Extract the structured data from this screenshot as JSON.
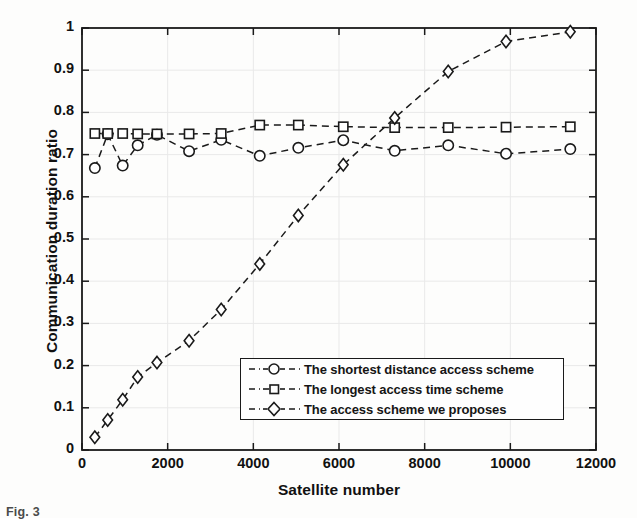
{
  "figure": {
    "caption": "Fig. 3"
  },
  "chart_data": {
    "type": "line",
    "title": "",
    "xlabel": "Satellite number",
    "ylabel": "Communication duration ratio",
    "xlim": [
      0,
      12000
    ],
    "ylim": [
      0,
      1
    ],
    "xticks": [
      0,
      2000,
      4000,
      6000,
      8000,
      10000,
      12000
    ],
    "xtick_labels": [
      "0",
      "2000",
      "4000",
      "6000",
      "8000",
      "10000",
      "12000"
    ],
    "yticks": [
      0,
      0.1,
      0.2,
      0.3,
      0.4,
      0.5,
      0.6,
      0.7,
      0.8,
      0.9,
      1
    ],
    "ytick_labels": [
      "0",
      "0.1",
      "0.2",
      "0.3",
      "0.4",
      "0.5",
      "0.6",
      "0.7",
      "0.8",
      "0.9",
      "1"
    ],
    "grid": true,
    "legend_position": "lower-center-right",
    "linestyle": "dashed",
    "color": "#1a1a1a",
    "series": [
      {
        "name": "The shortest distance access scheme",
        "marker": "circle",
        "x": [
          300,
          600,
          950,
          1300,
          1750,
          2500,
          3250,
          4150,
          5050,
          6100,
          7300,
          8550,
          9900,
          11400
        ],
        "y": [
          0.668,
          0.748,
          0.674,
          0.722,
          0.747,
          0.708,
          0.735,
          0.697,
          0.716,
          0.734,
          0.709,
          0.722,
          0.702,
          0.713
        ]
      },
      {
        "name": "The longest access time scheme",
        "marker": "square",
        "x": [
          300,
          600,
          950,
          1300,
          1750,
          2500,
          3250,
          4150,
          5050,
          6100,
          7300,
          8550,
          9900,
          11400
        ],
        "y": [
          0.75,
          0.75,
          0.75,
          0.749,
          0.749,
          0.749,
          0.75,
          0.77,
          0.77,
          0.766,
          0.764,
          0.764,
          0.765,
          0.766
        ]
      },
      {
        "name": "The access scheme we proposes",
        "marker": "diamond",
        "x": [
          300,
          600,
          950,
          1300,
          1750,
          2500,
          3250,
          4150,
          5050,
          6100,
          7300,
          8550,
          9900,
          11400
        ],
        "y": [
          0.03,
          0.071,
          0.119,
          0.173,
          0.207,
          0.259,
          0.333,
          0.441,
          0.556,
          0.676,
          0.787,
          0.897,
          0.968,
          0.991
        ]
      }
    ]
  },
  "legend": {
    "entries": [
      {
        "label": "The shortest distance access scheme",
        "marker": "circle"
      },
      {
        "label": "The longest access time scheme",
        "marker": "square"
      },
      {
        "label": "The access scheme we proposes",
        "marker": "diamond"
      }
    ]
  }
}
